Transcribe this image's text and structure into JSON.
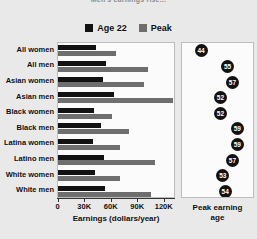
{
  "title": "Men's earnings rise...",
  "legend": {
    "items": [
      {
        "label": "Age 22",
        "color": "#121212",
        "key": "age22"
      },
      {
        "label": "Peak",
        "color": "#6e6e6e",
        "key": "peak"
      }
    ]
  },
  "axes": {
    "x_label": "Earnings (dollars/year)",
    "x_ticklabels": [
      "0",
      "30K",
      "60K",
      "90K",
      "120K"
    ],
    "right_label_line1": "Peak earning",
    "right_label_line2": "age"
  },
  "chart_data": {
    "type": "bar",
    "orientation": "horizontal",
    "title": "Men's earnings rise...",
    "xlabel": "Earnings (dollars/year)",
    "ylabel": "",
    "xlim": [
      0,
      135000
    ],
    "xticks": [
      0,
      30000,
      60000,
      90000,
      120000
    ],
    "xticklabels": [
      "0",
      "30K",
      "60K",
      "90K",
      "120K"
    ],
    "grid": false,
    "legend_position": "top-center",
    "categories": [
      "All women",
      "All men",
      "Asian women",
      "Asian men",
      "Black women",
      "Black men",
      "Latina women",
      "Latino men",
      "White women",
      "White men"
    ],
    "series": [
      {
        "name": "Age 22",
        "color": "#121212",
        "values": [
          42000,
          54000,
          50000,
          63000,
          40000,
          48000,
          39000,
          51000,
          41000,
          52000
        ]
      },
      {
        "name": "Peak",
        "color": "#6e6e6e",
        "values": [
          65000,
          101000,
          96000,
          129000,
          60000,
          80000,
          69000,
          109000,
          69000,
          104000
        ]
      }
    ],
    "secondary_panel": {
      "type": "scatter",
      "title": "Peak earning age",
      "xlabel": "Peak earning age",
      "xlim": [
        40,
        62
      ],
      "values": [
        44,
        55,
        57,
        52,
        52,
        59,
        59,
        57,
        53,
        54
      ],
      "categories": [
        "All women",
        "All men",
        "Asian women",
        "Asian men",
        "Black women",
        "Black men",
        "Latina women",
        "Latino men",
        "White women",
        "White men"
      ]
    }
  }
}
